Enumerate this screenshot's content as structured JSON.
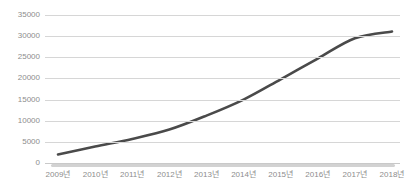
{
  "chart_data": {
    "type": "line",
    "title": "",
    "xlabel": "",
    "ylabel": "",
    "categories": [
      "2009년",
      "2010년",
      "2011년",
      "2012년",
      "2013년",
      "2014년",
      "2015년",
      "2016년",
      "2017년",
      "2018년"
    ],
    "values": [
      2000,
      3900,
      5700,
      7900,
      11200,
      15000,
      19800,
      24700,
      29500,
      31100
    ],
    "series": [
      {
        "name": "",
        "color": "#4a4a4a",
        "values": [
          2000,
          3900,
          5700,
          7900,
          11200,
          15000,
          19800,
          24700,
          29500,
          31100
        ]
      }
    ],
    "ylim": [
      0,
      35000
    ],
    "y_ticks": [
      0,
      5000,
      10000,
      15000,
      20000,
      25000,
      30000,
      35000
    ],
    "y_tick_labels": [
      "0",
      "5000",
      "10000",
      "15000",
      "20000",
      "25000",
      "30000",
      "35000"
    ],
    "grid": true,
    "grid_axis": "y",
    "legend": false,
    "legend_position": "none",
    "markers": false,
    "smoothing": true
  },
  "style": {
    "line_color": "#4a4a4a",
    "grid_color": "#d6d6d6",
    "axis_color": "#c9c9c9",
    "baseline_band_color": "#d2d2d2",
    "tick_label_color": "#8d8d8d",
    "background": "#ffffff"
  }
}
